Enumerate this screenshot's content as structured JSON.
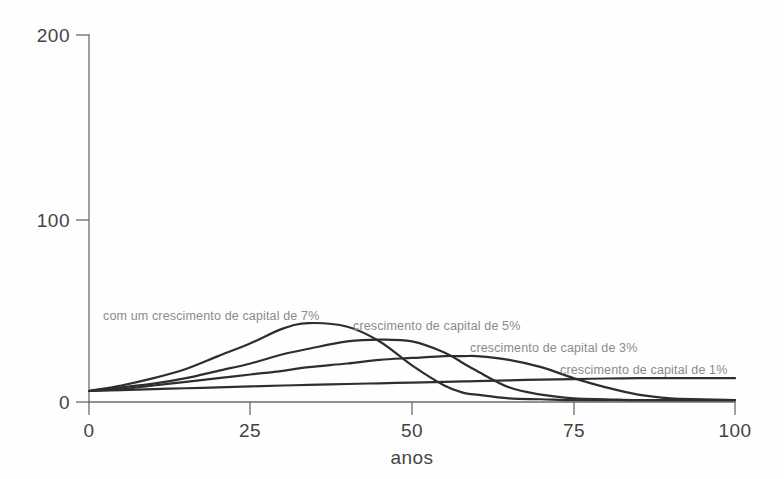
{
  "chart_data": {
    "type": "line",
    "title": "",
    "subtitle": "",
    "xlabel": "anos",
    "ylabel": "",
    "xlim": [
      0,
      100
    ],
    "ylim": [
      0,
      200
    ],
    "grid": false,
    "legend_position": "inline-annotations",
    "x_ticks": [
      "0",
      "25",
      "50",
      "75",
      "100"
    ],
    "x_tick_values": [
      0,
      25,
      50,
      75,
      100
    ],
    "y_ticks": [
      "0",
      "100",
      "200"
    ],
    "y_tick_values": [
      0,
      100,
      200
    ],
    "x": [
      0,
      5,
      10,
      15,
      20,
      25,
      30,
      34,
      40,
      45,
      50,
      55,
      58,
      60,
      65,
      70,
      75,
      80,
      85,
      90,
      95,
      100
    ],
    "series": [
      {
        "name": "com um crescimento de capital de 7%",
        "label": "com um crescimento de capital de 7%",
        "rate_percent": 7,
        "peak_x": 34,
        "peak_y": 43,
        "color": "#2e2e2e",
        "values": [
          6,
          9,
          13,
          18,
          25,
          32,
          40,
          43,
          41,
          33,
          20,
          9,
          5,
          4,
          2,
          1.5,
          1,
          1,
          1,
          1,
          1,
          1
        ]
      },
      {
        "name": "crescimento de capital de 5%",
        "label": "crescimento de capital de 5%",
        "rate_percent": 5,
        "peak_x": 45,
        "peak_y": 34,
        "color": "#2e2e2e",
        "values": [
          6,
          8,
          10,
          13,
          17,
          21,
          26,
          29,
          33,
          34,
          33,
          27,
          21,
          17,
          8,
          4,
          2,
          1.5,
          1,
          1,
          1,
          1
        ]
      },
      {
        "name": "crescimento de capital de 3%",
        "label": "crescimento de capital de 3%",
        "rate_percent": 3,
        "peak_x": 58,
        "peak_y": 25,
        "color": "#2e2e2e",
        "values": [
          6,
          7,
          9,
          11,
          13,
          15,
          17,
          19,
          21,
          23,
          24,
          25,
          25,
          25,
          23,
          19,
          13,
          8,
          4,
          2,
          1.5,
          1
        ]
      },
      {
        "name": "crescimento de capital de 1%",
        "label": "crescimento de capital de 1%",
        "rate_percent": 1,
        "peak_x": 85,
        "peak_y": 13,
        "color": "#2e2e2e",
        "values": [
          6,
          6.5,
          7,
          7.5,
          8,
          8.5,
          9,
          9.3,
          9.8,
          10.2,
          10.6,
          11,
          11.2,
          11.4,
          11.8,
          12.2,
          12.5,
          12.8,
          13,
          13,
          13,
          13
        ]
      }
    ],
    "annotations": [
      {
        "text": "com um crescimento de capital de 7%",
        "x_px": 103,
        "y_px": 320
      },
      {
        "text": "crescimento de capital de 5%",
        "x_px": 353,
        "y_px": 330
      },
      {
        "text": "crescimento de capital de 3%",
        "x_px": 470,
        "y_px": 352
      },
      {
        "text": "crescimento de capital de 1%",
        "x_px": 560,
        "y_px": 374
      }
    ]
  },
  "axes": {
    "y_tick_200": "200",
    "y_tick_100": "100",
    "y_tick_0": "0",
    "x_tick_0": "0",
    "x_tick_25": "25",
    "x_tick_50": "50",
    "x_tick_75": "75",
    "x_tick_100": "100",
    "x_axis_title": "anos"
  },
  "colors": {
    "background": "#fefefe",
    "axis": "#6b6b6b",
    "curve": "#2e2e2e",
    "tick_text": "#444444",
    "annotation_text": "#8a8a8a"
  }
}
